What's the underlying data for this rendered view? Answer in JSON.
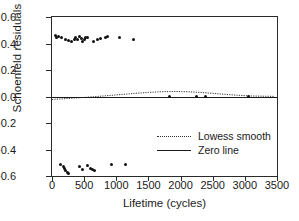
{
  "chart_data": {
    "type": "scatter",
    "title": "",
    "xlabel": "Lifetime (cycles)",
    "ylabel": "Schoenfeld residuals",
    "xlim": [
      0,
      3500
    ],
    "ylim": [
      -0.6,
      0.6
    ],
    "xticks": [
      0,
      500,
      1000,
      1500,
      2000,
      2500,
      3000,
      3500
    ],
    "xtick_labels": [
      "0",
      "500",
      "1000",
      "1500",
      "2000",
      "2500",
      "3000",
      "3500"
    ],
    "yticks": [
      -0.6,
      -0.4,
      -0.2,
      0.0,
      0.2,
      0.4,
      0.6
    ],
    "ytick_labels": [
      "-0.6",
      "-0.4",
      "-0.2",
      "0.0",
      "0.2",
      "0.4",
      "0.6"
    ],
    "grid": false,
    "legend_position": "center-right",
    "series": [
      {
        "name": "Schoenfeld residuals",
        "type": "scatter",
        "marker": "filled-circle",
        "color": "#111111",
        "points": [
          {
            "x": 60,
            "y": 0.462
          },
          {
            "x": 70,
            "y": 0.448
          },
          {
            "x": 95,
            "y": 0.455
          },
          {
            "x": 150,
            "y": 0.448
          },
          {
            "x": 215,
            "y": 0.43
          },
          {
            "x": 260,
            "y": 0.42
          },
          {
            "x": 300,
            "y": 0.412
          },
          {
            "x": 345,
            "y": 0.432
          },
          {
            "x": 370,
            "y": 0.445
          },
          {
            "x": 400,
            "y": 0.428
          },
          {
            "x": 430,
            "y": 0.455
          },
          {
            "x": 455,
            "y": 0.44
          },
          {
            "x": 470,
            "y": 0.418
          },
          {
            "x": 500,
            "y": 0.43
          },
          {
            "x": 520,
            "y": 0.448
          },
          {
            "x": 545,
            "y": 0.442
          },
          {
            "x": 640,
            "y": 0.418
          },
          {
            "x": 700,
            "y": 0.432
          },
          {
            "x": 760,
            "y": 0.44
          },
          {
            "x": 830,
            "y": 0.448
          },
          {
            "x": 870,
            "y": 0.452
          },
          {
            "x": 1050,
            "y": 0.448
          },
          {
            "x": 1270,
            "y": 0.428
          },
          {
            "x": 1820,
            "y": 0.0
          },
          {
            "x": 2250,
            "y": 0.0
          },
          {
            "x": 2380,
            "y": 0.0
          },
          {
            "x": 3060,
            "y": 0.0
          },
          {
            "x": 130,
            "y": -0.515
          },
          {
            "x": 175,
            "y": -0.53
          },
          {
            "x": 200,
            "y": -0.545
          },
          {
            "x": 215,
            "y": -0.56
          },
          {
            "x": 240,
            "y": -0.57
          },
          {
            "x": 255,
            "y": -0.578
          },
          {
            "x": 420,
            "y": -0.528
          },
          {
            "x": 475,
            "y": -0.552
          },
          {
            "x": 555,
            "y": -0.52
          },
          {
            "x": 600,
            "y": -0.54
          },
          {
            "x": 625,
            "y": -0.552
          },
          {
            "x": 660,
            "y": -0.562
          },
          {
            "x": 930,
            "y": -0.51
          },
          {
            "x": 1150,
            "y": -0.512
          }
        ]
      },
      {
        "name": "Lowess smooth",
        "type": "line",
        "style": "dotted",
        "color": "#333333",
        "points": [
          {
            "x": 0,
            "y": -0.022
          },
          {
            "x": 150,
            "y": -0.018
          },
          {
            "x": 300,
            "y": -0.013
          },
          {
            "x": 500,
            "y": -0.007
          },
          {
            "x": 700,
            "y": 0.0
          },
          {
            "x": 900,
            "y": 0.008
          },
          {
            "x": 1100,
            "y": 0.016
          },
          {
            "x": 1300,
            "y": 0.024
          },
          {
            "x": 1500,
            "y": 0.031
          },
          {
            "x": 1700,
            "y": 0.036
          },
          {
            "x": 1900,
            "y": 0.038
          },
          {
            "x": 2100,
            "y": 0.036
          },
          {
            "x": 2300,
            "y": 0.031
          },
          {
            "x": 2500,
            "y": 0.024
          },
          {
            "x": 2700,
            "y": 0.016
          },
          {
            "x": 2900,
            "y": 0.009
          },
          {
            "x": 3100,
            "y": 0.004
          },
          {
            "x": 3300,
            "y": 0.002
          },
          {
            "x": 3450,
            "y": 0.001
          }
        ]
      },
      {
        "name": "Zero line",
        "type": "line",
        "style": "solid",
        "color": "#1a1a1a",
        "y_value": 0.0
      }
    ],
    "legend": [
      {
        "label": "Lowess smooth",
        "style": "dotted"
      },
      {
        "label": "Zero line",
        "style": "solid"
      }
    ]
  }
}
